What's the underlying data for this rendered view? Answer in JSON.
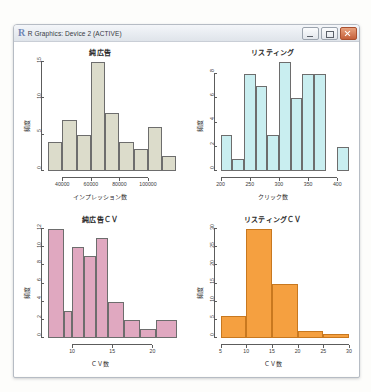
{
  "window": {
    "title": "R Graphics: Device 2 (ACTIVE)",
    "logo": "R",
    "minimize_label": "Minimize",
    "maximize_label": "Maximize",
    "close_label": "Close"
  },
  "chart_data": [
    {
      "type": "bar",
      "id": "pure-ad-impressions",
      "title": "純広告",
      "xlabel": "インプレッション数",
      "ylabel": "頻度",
      "color": "#dcdccb",
      "border": "#6d6d6d",
      "xlim": [
        30000,
        120000
      ],
      "ylim": [
        0,
        15
      ],
      "xticks": [
        40000,
        60000,
        80000,
        100000
      ],
      "xtick_labels": [
        "40000",
        "60000",
        "80000",
        "100000"
      ],
      "yticks": [
        0,
        5,
        10,
        15
      ],
      "ytick_labels": [
        "0",
        "5",
        "10",
        "15"
      ],
      "bin_edges": [
        30000,
        40000,
        50000,
        60000,
        70000,
        80000,
        90000,
        100000,
        110000,
        120000
      ],
      "categories": [
        "30-40k",
        "40-50k",
        "50-60k",
        "60-70k",
        "70-80k",
        "80-90k",
        "90-100k",
        "100-110k",
        "110-120k"
      ],
      "values": [
        4,
        7,
        5,
        15,
        8,
        4,
        3,
        6,
        2
      ],
      "grid": false,
      "legend": "none"
    },
    {
      "type": "bar",
      "id": "listing-clicks",
      "title": "リスティング",
      "xlabel": "クリック数",
      "ylabel": "頻度",
      "color": "#c9eef0",
      "border": "#6d6d6d",
      "xlim": [
        200,
        420
      ],
      "ylim": [
        0,
        9
      ],
      "xticks": [
        200,
        250,
        300,
        350,
        400
      ],
      "xtick_labels": [
        "200",
        "250",
        "300",
        "350",
        "400"
      ],
      "yticks": [
        0,
        2,
        4,
        6,
        8
      ],
      "ytick_labels": [
        "0",
        "2",
        "4",
        "6",
        "8"
      ],
      "bin_edges": [
        200,
        220,
        240,
        260,
        280,
        300,
        320,
        340,
        360,
        380,
        400,
        420
      ],
      "categories": [
        "200-220",
        "220-240",
        "240-260",
        "260-280",
        "280-300",
        "300-320",
        "320-340",
        "340-360",
        "360-380",
        "380-400",
        "400-420"
      ],
      "values": [
        3,
        1,
        8,
        7,
        3,
        9,
        6,
        8,
        8,
        0,
        2
      ],
      "grid": false,
      "legend": "none"
    },
    {
      "type": "bar",
      "id": "pure-ad-cv",
      "title": "純広告ＣＶ",
      "xlabel": "ＣＶ数",
      "ylabel": "頻度",
      "color": "#e0a8c0",
      "border": "#6d6d6d",
      "xlim": [
        7,
        23
      ],
      "ylim": [
        0,
        12
      ],
      "xticks": [
        10,
        15,
        20
      ],
      "xtick_labels": [
        "10",
        "15",
        "20"
      ],
      "yticks": [
        0,
        2,
        4,
        6,
        8,
        10,
        12
      ],
      "ytick_labels": [
        "0",
        "2",
        "4",
        "6",
        "8",
        "10",
        "12"
      ],
      "bin_edges": [
        7,
        9,
        10,
        11.5,
        13,
        14.5,
        16.5,
        18.5,
        20.5,
        23
      ],
      "categories": [
        "7-9",
        "9-10",
        "10-11.5",
        "11.5-13",
        "13-14.5",
        "14.5-16.5",
        "16.5-18.5",
        "18.5-20.5",
        "20.5-23"
      ],
      "values": [
        12,
        3,
        10,
        9,
        11,
        4,
        2,
        1,
        2
      ],
      "grid": false,
      "legend": "none"
    },
    {
      "type": "bar",
      "id": "listing-cv",
      "title": "リスティングＣＶ",
      "xlabel": "ＣＶ数",
      "ylabel": "頻度",
      "color": "#f5a040",
      "border": "#c8781f",
      "xlim": [
        5,
        30
      ],
      "ylim": [
        0,
        30
      ],
      "xticks": [
        5,
        10,
        15,
        20,
        25,
        30
      ],
      "xtick_labels": [
        "5",
        "10",
        "15",
        "20",
        "25",
        "30"
      ],
      "yticks": [
        0,
        5,
        10,
        15,
        20,
        25,
        30
      ],
      "ytick_labels": [
        "0",
        "5",
        "10",
        "15",
        "20",
        "25",
        "30"
      ],
      "bin_edges": [
        5,
        10,
        15,
        20,
        25,
        30
      ],
      "categories": [
        "5-10",
        "10-15",
        "15-20",
        "20-25",
        "25-30"
      ],
      "values": [
        6,
        30,
        15,
        2,
        1
      ],
      "grid": false,
      "legend": "none"
    }
  ]
}
